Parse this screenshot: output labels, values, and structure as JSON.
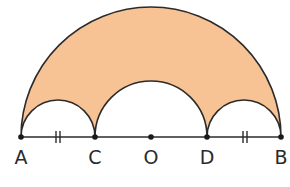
{
  "diagram": {
    "fill_color": "#f7c395",
    "stroke_color": "#2b2b2b",
    "points": [
      {
        "name": "A",
        "x": 21
      },
      {
        "name": "C",
        "x": 95
      },
      {
        "name": "O",
        "x": 151
      },
      {
        "name": "D",
        "x": 207
      },
      {
        "name": "B",
        "x": 281
      }
    ],
    "labels": {
      "A": "A",
      "C": "C",
      "O": "O",
      "D": "D",
      "B": "B"
    },
    "tick_marks": [
      "AC equal to DB (double tick)"
    ]
  }
}
